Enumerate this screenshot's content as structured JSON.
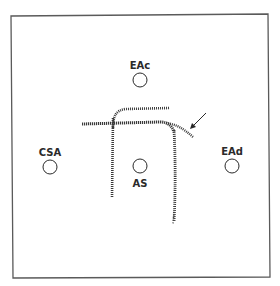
{
  "figure": {
    "sites": [
      {
        "id": "EAc",
        "label": "EAc",
        "cx": 140,
        "cy": 80,
        "label_x": 140,
        "label_y": 69
      },
      {
        "id": "CSA",
        "label": "CSA",
        "cx": 50,
        "cy": 167,
        "label_x": 50,
        "label_y": 156
      },
      {
        "id": "AS",
        "label": "AS",
        "cx": 140,
        "cy": 166,
        "label_x": 140,
        "label_y": 187
      },
      {
        "id": "EAd",
        "label": "EAd",
        "cx": 232,
        "cy": 166,
        "label_x": 232,
        "label_y": 155
      }
    ],
    "colors": {
      "frame": "#5a5a5a",
      "ink": "#2a2a2a",
      "track": "#3a3a3a",
      "background": "#ffffff"
    }
  }
}
